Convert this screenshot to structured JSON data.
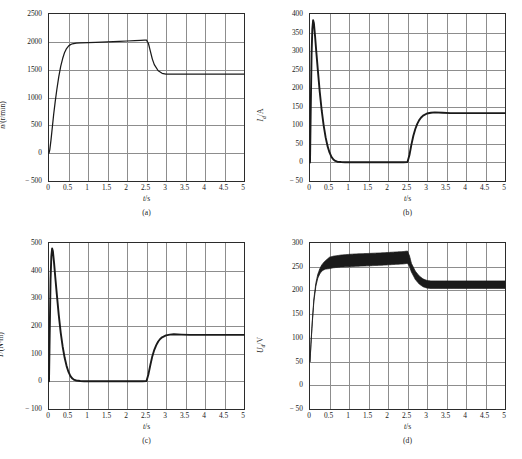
{
  "figure": {
    "title": "",
    "panel_labels": [
      "(a)",
      "(b)",
      "(c)",
      "(d)"
    ]
  },
  "chart_data": [
    {
      "type": "line",
      "panel": "(a)",
      "title": "",
      "xlabel": "t/s",
      "ylabel": "n/(r/min)",
      "ylabel_symbol": "n",
      "ylabel_unit": "(r/min)",
      "xlim": [
        0,
        5
      ],
      "ylim": [
        -500,
        2500
      ],
      "xticks": [
        "0",
        "0.5",
        "1",
        "1.5",
        "2",
        "2.5",
        "3",
        "3.5",
        "4",
        "4.5",
        "5"
      ],
      "xtick_values": [
        0,
        0.5,
        1,
        1.5,
        2,
        2.5,
        3,
        3.5,
        4,
        4.5,
        5
      ],
      "yticks": [
        "2500",
        "2000",
        "1500",
        "1000",
        "500",
        "0",
        "-500"
      ],
      "ytick_values": [
        2500,
        2000,
        1500,
        1000,
        500,
        0,
        -500
      ],
      "grid": true,
      "legend": "none",
      "series": [
        {
          "name": "speed",
          "color": "#1a1a1a",
          "x": [
            0,
            0.02,
            0.05,
            0.08,
            0.12,
            0.16,
            0.2,
            0.25,
            0.3,
            0.35,
            0.4,
            0.45,
            0.5,
            0.55,
            0.6,
            0.7,
            0.8,
            1.0,
            1.2,
            1.5,
            1.8,
            2.0,
            2.2,
            2.35,
            2.45,
            2.5,
            2.55,
            2.6,
            2.65,
            2.7,
            2.8,
            2.9,
            3.0,
            3.1,
            3.3,
            3.6,
            4.0,
            4.5,
            5.0
          ],
          "y": [
            0,
            60,
            230,
            430,
            700,
            930,
            1140,
            1370,
            1560,
            1700,
            1810,
            1880,
            1925,
            1950,
            1965,
            1975,
            1980,
            1985,
            1992,
            2000,
            2010,
            2015,
            2022,
            2028,
            2032,
            2030,
            1970,
            1830,
            1690,
            1590,
            1480,
            1435,
            1420,
            1418,
            1418,
            1420,
            1420,
            1420,
            1420
          ]
        }
      ],
      "annotations": [
        {
          "text": "load step applied",
          "t": 2.5
        }
      ]
    },
    {
      "type": "line",
      "panel": "(b)",
      "title": "",
      "xlabel": "t/s",
      "ylabel": "Id/A",
      "ylabel_symbol": "I",
      "ylabel_sub": "d",
      "ylabel_unit": "A",
      "xlim": [
        0,
        5
      ],
      "ylim": [
        -50,
        400
      ],
      "xticks": [
        "0",
        "0.5",
        "1",
        "1.5",
        "2",
        "2.5",
        "3",
        "3.5",
        "4",
        "4.5",
        "5"
      ],
      "xtick_values": [
        0,
        0.5,
        1,
        1.5,
        2,
        2.5,
        3,
        3.5,
        4,
        4.5,
        5
      ],
      "yticks": [
        "400",
        "350",
        "300",
        "250",
        "200",
        "150",
        "100",
        "50",
        "0",
        "-50"
      ],
      "ytick_values": [
        400,
        350,
        300,
        250,
        200,
        150,
        100,
        50,
        0,
        -50
      ],
      "grid": true,
      "legend": "none",
      "series": [
        {
          "name": "armature-current",
          "color": "#1a1a1a",
          "x": [
            0,
            0.02,
            0.04,
            0.06,
            0.08,
            0.1,
            0.13,
            0.16,
            0.2,
            0.25,
            0.3,
            0.35,
            0.4,
            0.45,
            0.5,
            0.55,
            0.6,
            0.65,
            0.7,
            0.8,
            0.9,
            1.0,
            1.5,
            2.0,
            2.4,
            2.5,
            2.55,
            2.6,
            2.65,
            2.7,
            2.75,
            2.8,
            2.85,
            2.9,
            3.0,
            3.1,
            3.2,
            3.4,
            3.6,
            4.0,
            4.5,
            5.0
          ],
          "y": [
            0,
            150,
            290,
            360,
            383,
            375,
            340,
            300,
            250,
            190,
            140,
            100,
            68,
            44,
            27,
            15,
            8,
            4,
            2,
            1,
            0.5,
            0.5,
            0.5,
            0.5,
            0.5,
            1,
            20,
            48,
            72,
            90,
            104,
            114,
            121,
            126,
            132,
            134,
            135,
            134,
            133,
            133,
            133,
            133
          ]
        }
      ]
    },
    {
      "type": "line",
      "panel": "(c)",
      "title": "",
      "xlabel": "t/s",
      "ylabel": "T/(N·m)",
      "ylabel_symbol": "T",
      "ylabel_unit": "(N·m)",
      "xlim": [
        0,
        5
      ],
      "ylim": [
        -100,
        500
      ],
      "xticks": [
        "0",
        "0.5",
        "1",
        "1.5",
        "2",
        "2.5",
        "3",
        "3.5",
        "4",
        "4.5",
        "5"
      ],
      "xtick_values": [
        0,
        0.5,
        1,
        1.5,
        2,
        2.5,
        3,
        3.5,
        4,
        4.5,
        5
      ],
      "yticks": [
        "500",
        "400",
        "300",
        "200",
        "100",
        "0",
        "-100"
      ],
      "ytick_values": [
        500,
        400,
        300,
        200,
        100,
        0,
        -100
      ],
      "grid": true,
      "legend": "none",
      "series": [
        {
          "name": "torque",
          "color": "#1a1a1a",
          "x": [
            0,
            0.02,
            0.04,
            0.06,
            0.08,
            0.1,
            0.13,
            0.16,
            0.2,
            0.25,
            0.3,
            0.35,
            0.4,
            0.45,
            0.5,
            0.55,
            0.6,
            0.65,
            0.7,
            0.8,
            0.9,
            1.0,
            1.5,
            2.0,
            2.4,
            2.5,
            2.55,
            2.6,
            2.65,
            2.7,
            2.75,
            2.8,
            2.85,
            2.9,
            3.0,
            3.1,
            3.2,
            3.4,
            3.6,
            4.0,
            4.5,
            5.0
          ],
          "y": [
            0,
            190,
            370,
            452,
            480,
            470,
            428,
            378,
            315,
            240,
            176,
            126,
            86,
            56,
            34,
            19,
            10,
            5,
            3,
            1,
            0.5,
            0.5,
            0.5,
            0.5,
            0.5,
            1,
            26,
            60,
            91,
            114,
            131,
            144,
            153,
            159,
            166,
            169,
            170,
            169,
            168,
            168,
            168,
            168
          ]
        }
      ]
    },
    {
      "type": "line",
      "panel": "(d)",
      "title": "",
      "xlabel": "t/s",
      "ylabel": "Ud/V",
      "ylabel_symbol": "U",
      "ylabel_sub": "d",
      "ylabel_unit": "V",
      "xlim": [
        0,
        5
      ],
      "ylim": [
        -50,
        300
      ],
      "xticks": [
        "0",
        "0.5",
        "1",
        "1.5",
        "2",
        "2.5",
        "3",
        "3.5",
        "4",
        "4.5",
        "5"
      ],
      "xtick_values": [
        0,
        0.5,
        1,
        1.5,
        2,
        2.5,
        3,
        3.5,
        4,
        4.5,
        5
      ],
      "yticks": [
        "300",
        "250",
        "200",
        "150",
        "100",
        "50",
        "0",
        "-50"
      ],
      "ytick_values": [
        300,
        250,
        200,
        150,
        100,
        50,
        0,
        -50
      ],
      "grid": true,
      "legend": "none",
      "note": "trace drawn as thick ripple band (PWM ripple)",
      "series": [
        {
          "name": "armature-voltage-mean",
          "color": "#1a1a1a",
          "x": [
            0,
            0.03,
            0.06,
            0.1,
            0.15,
            0.2,
            0.25,
            0.3,
            0.35,
            0.4,
            0.45,
            0.5,
            0.6,
            0.7,
            0.8,
            1.0,
            1.2,
            1.5,
            1.8,
            2.0,
            2.2,
            2.4,
            2.5,
            2.55,
            2.6,
            2.7,
            2.8,
            2.9,
            3.0,
            3.1,
            3.3,
            3.6,
            4.0,
            4.5,
            5.0
          ],
          "y": [
            50,
            95,
            135,
            180,
            212,
            230,
            240,
            247,
            251,
            254,
            256,
            258,
            260,
            261,
            262,
            263,
            264,
            265,
            266,
            267,
            268,
            269,
            270,
            262,
            248,
            232,
            222,
            216,
            213,
            212,
            212,
            212,
            212,
            212,
            212
          ]
        },
        {
          "name": "ripple-half-width",
          "color": "#1a1a1a",
          "x": [
            0,
            0.2,
            0.4,
            0.5,
            1.0,
            2.0,
            2.5,
            2.6,
            3.0,
            4.0,
            5.0
          ],
          "y": [
            1,
            4,
            9,
            12,
            13,
            13,
            13,
            9,
            8,
            8,
            8
          ]
        }
      ]
    }
  ]
}
